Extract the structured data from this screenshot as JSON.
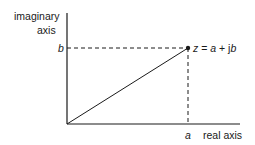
{
  "diagram": {
    "type": "complex-plane",
    "y_axis_label_line1": "imaginary",
    "y_axis_label_line2": "axis",
    "x_axis_label": "real axis",
    "b_label": "b",
    "a_label": "a",
    "point_label_z": "z",
    "point_label_eq": " = ",
    "point_label_a": "a",
    "point_label_plus": " + j",
    "point_label_b": "b",
    "colors": {
      "line": "#1a1a1a",
      "background": "#ffffff"
    }
  }
}
